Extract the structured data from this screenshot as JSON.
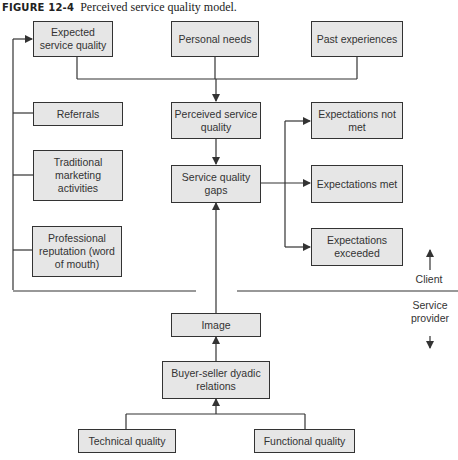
{
  "caption": {
    "figure_label": "FIGURE 12-4",
    "title": "Perceived service quality model."
  },
  "nodes": {
    "expected_service_quality": "Expected service quality",
    "personal_needs": "Personal needs",
    "past_experiences": "Past experiences",
    "referrals": "Referrals",
    "perceived_service_quality": "Perceived service quality",
    "expectations_not_met": "Expectations not met",
    "traditional_marketing": "Traditional marketing activities",
    "service_quality_gaps": "Service quality gaps",
    "expectations_met": "Expectations met",
    "professional_reputation": "Professional reputation (word of mouth)",
    "expectations_exceeded": "Expectations exceeded",
    "image": "Image",
    "buyer_seller": "Buyer-seller dyadic relations",
    "technical_quality": "Technical quality",
    "functional_quality": "Functional quality"
  },
  "side_labels": {
    "client": "Client",
    "service_provider": "Service provider"
  },
  "colors": {
    "box_fill": "#e6e6e6",
    "line": "#333333"
  }
}
